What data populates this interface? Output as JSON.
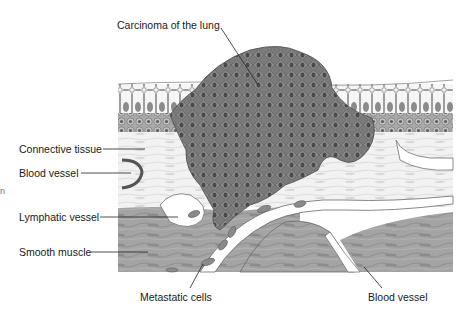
{
  "figure": {
    "clipped_edge_glyph": "n"
  },
  "labels": {
    "carcinoma": "Carcinoma of the lung",
    "connective_tissue": "Connective tissue",
    "blood_vessel_left": "Blood vessel",
    "lymphatic_vessel": "Lymphatic vessel",
    "smooth_muscle": "Smooth muscle",
    "metastatic_cells": "Metastatic cells",
    "blood_vessel_bottom": "Blood vessel"
  },
  "colors": {
    "background": "#ffffff",
    "epithelium": "#e9e9e9",
    "basal_layer": "#9a9a9a",
    "connective_tissue": "#f1f1f1",
    "tumor": "#7d7d7d",
    "tumor_nuclei": "#4e4e4e",
    "smooth_muscle": "#a8a8a8",
    "vessel_lumen": "#ffffff",
    "leader_line": "#222222",
    "text": "#1a1a1a"
  }
}
